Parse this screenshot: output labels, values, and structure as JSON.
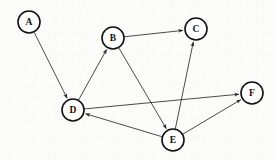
{
  "chart_data": {
    "type": "diagram",
    "diagram_type": "directed-graph",
    "title": "",
    "background_color": "#fbfbfa",
    "node_fill_color": "#ffffff",
    "node_stroke_color": "#111111",
    "edge_color": "#2b2b2b",
    "node_radius": 11,
    "nodes": [
      {
        "id": "A",
        "label": "A",
        "x": 29,
        "y": 22
      },
      {
        "id": "B",
        "label": "B",
        "x": 113,
        "y": 38
      },
      {
        "id": "C",
        "label": "C",
        "x": 196,
        "y": 29
      },
      {
        "id": "D",
        "label": "D",
        "x": 73,
        "y": 110
      },
      {
        "id": "E",
        "label": "E",
        "x": 173,
        "y": 140
      },
      {
        "id": "F",
        "label": "F",
        "x": 252,
        "y": 93
      }
    ],
    "edges": [
      {
        "from": "A",
        "to": "D",
        "directed": true
      },
      {
        "from": "D",
        "to": "B",
        "directed": true
      },
      {
        "from": "B",
        "to": "C",
        "directed": true
      },
      {
        "from": "B",
        "to": "E",
        "directed": true
      },
      {
        "from": "E",
        "to": "C",
        "directed": true
      },
      {
        "from": "E",
        "to": "D",
        "directed": true
      },
      {
        "from": "D",
        "to": "F",
        "directed": true
      },
      {
        "from": "E",
        "to": "F",
        "directed": true
      }
    ],
    "node_count": 6,
    "edge_count": 8
  }
}
